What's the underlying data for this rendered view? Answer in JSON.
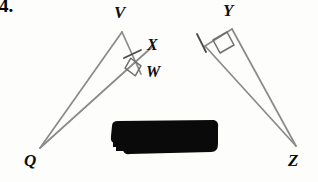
{
  "page": {
    "width": 318,
    "height": 182,
    "background": "#fdfdfb",
    "question_number": "4."
  },
  "figure": {
    "type": "geometry-diagram",
    "stroke_color": "#8a8a8a",
    "mark_color": "#6f6f6f",
    "stroke_width": 1.6,
    "points": {
      "V": {
        "x": 122,
        "y": 32
      },
      "W": {
        "x": 141,
        "y": 73
      },
      "X": {
        "x": 152,
        "y": 46
      },
      "Q": {
        "x": 40,
        "y": 148
      },
      "Y": {
        "x": 229,
        "y": 30
      },
      "Z": {
        "x": 296,
        "y": 146
      }
    },
    "segments": [
      {
        "name": "segment-QV",
        "from": "Q",
        "to": "V"
      },
      {
        "name": "segment-VW",
        "from": "V",
        "to": "W"
      },
      {
        "name": "segment-QW-extended",
        "from": "Q",
        "to": "Wext"
      },
      {
        "name": "segment-YZ-left",
        "from": "Yleft",
        "to": "Z"
      },
      {
        "name": "segment-YZ-right",
        "from": "Y",
        "to": "Z"
      },
      {
        "name": "segment-Y-top",
        "from": "Yleft",
        "to": "Y"
      }
    ],
    "right_angles": [
      {
        "name": "right-angle-W",
        "at": "W"
      },
      {
        "name": "right-angle-Y",
        "at": "Y"
      }
    ],
    "tick_marks": [
      {
        "name": "tick-mark-VW",
        "on": "segment-VW"
      },
      {
        "name": "tick-mark-YZ",
        "on": "segment-Y-left-leg"
      }
    ]
  },
  "labels": {
    "V": "V",
    "X": "X",
    "W": "W",
    "Q": "Q",
    "Y": "Y",
    "Z": "Z"
  },
  "redaction": {
    "name": "redaction-mark",
    "color": "#0a0a0a",
    "x": 112,
    "y": 119,
    "width": 104,
    "height": 37,
    "note": "heavy black marker blot covering text"
  }
}
